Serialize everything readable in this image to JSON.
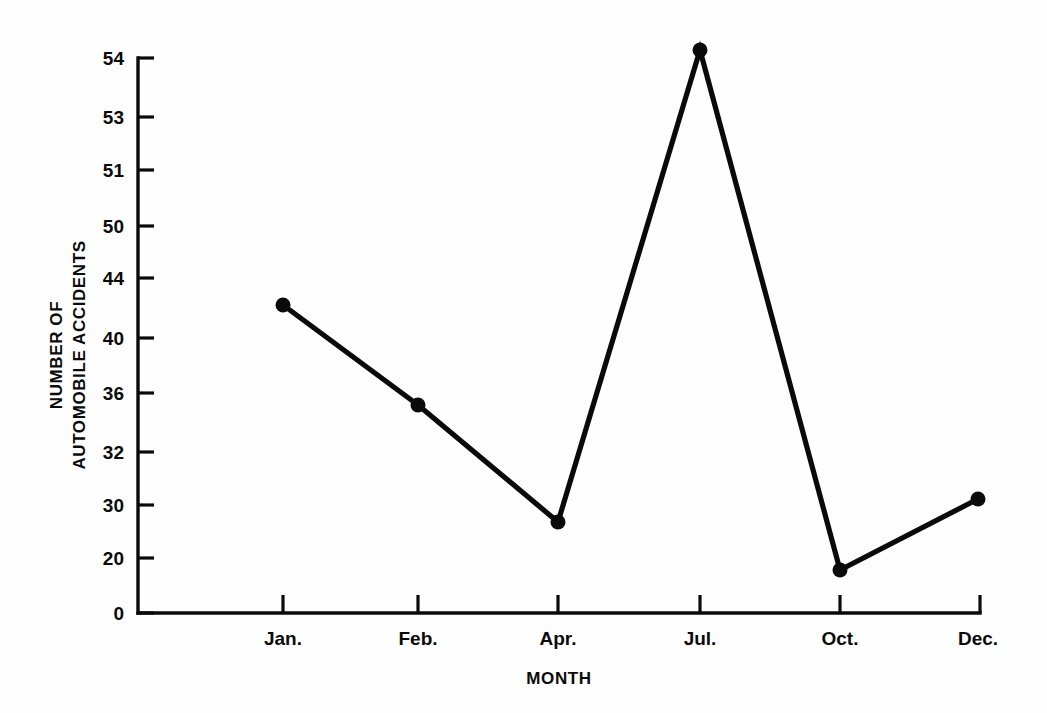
{
  "figure": {
    "background_color": "#fefefe",
    "ink_color": "#0a0a0a"
  },
  "chart_data": {
    "type": "line",
    "title": "",
    "subtitle": "",
    "xlabel": "MONTH",
    "ylabel": "NUMBER OF AUTOMOBILE ACCIDENTS",
    "ylabel_lines": [
      "NUMBER OF",
      "AUTOMOBILE ACCIDENTS"
    ],
    "categories": [
      "Jan.",
      "Feb.",
      "Apr.",
      "Jul.",
      "Oct.",
      "Dec."
    ],
    "values": [
      42,
      35,
      26.5,
      54.2,
      18.5,
      30.4
    ],
    "series": [
      {
        "name": "Number of automobile accidents",
        "values": [
          42,
          35,
          26.5,
          54.2,
          18.5,
          30.4
        ]
      }
    ],
    "x_tick_labels": [
      "Jan.",
      "Feb.",
      "Apr.",
      "Jul.",
      "Oct.",
      "Dec."
    ],
    "y_tick_labels": [
      "54",
      "53",
      "51",
      "50",
      "44",
      "40",
      "36",
      "32",
      "30",
      "20",
      "0"
    ],
    "y_tick_values": [
      54,
      53,
      51,
      50,
      44,
      40,
      36,
      32,
      30,
      20,
      0
    ],
    "y_axis_scale": "ordinal-nonuniform",
    "grid": false,
    "legend": false,
    "legend_position": "none",
    "marker": "filled-circle",
    "line_color": "#0a0a0a",
    "marker_color": "#0a0a0a"
  },
  "geometry": {
    "plot_left": 138,
    "plot_right": 980,
    "plot_top": 58,
    "plot_bottom": 613,
    "y_tick_pixels": [
      58,
      117,
      170,
      226,
      278,
      338,
      393,
      452,
      505,
      558,
      613
    ],
    "x_tick_pixels": [
      283,
      418,
      558,
      700,
      840,
      978
    ],
    "point_pixels": [
      [
        283,
        305
      ],
      [
        418,
        405
      ],
      [
        558,
        522
      ],
      [
        700,
        50
      ],
      [
        840,
        570
      ],
      [
        978,
        499
      ]
    ],
    "marker_radius": 7.5
  }
}
